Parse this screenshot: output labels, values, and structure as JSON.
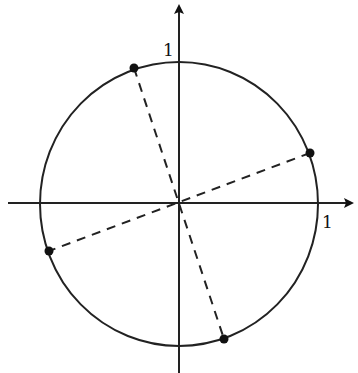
{
  "diagram": {
    "type": "unit-circle",
    "axes": {
      "x_label": "1",
      "y_label": "1",
      "arrow_color": "#111111"
    },
    "circle": {
      "center": [
        179,
        204
      ],
      "rx": 139,
      "ry": 142,
      "stroke": "#222222"
    },
    "points": [
      {
        "name": "point-upper-left",
        "x": 134,
        "y": 68
      },
      {
        "name": "point-right",
        "x": 310,
        "y": 153
      },
      {
        "name": "point-left",
        "x": 49,
        "y": 251
      },
      {
        "name": "point-lower-right",
        "x": 224,
        "y": 339
      }
    ],
    "dashed_diameters": [
      {
        "from": [
          134,
          68
        ],
        "to": [
          224,
          339
        ]
      },
      {
        "from": [
          310,
          153
        ],
        "to": [
          49,
          251
        ]
      }
    ]
  }
}
